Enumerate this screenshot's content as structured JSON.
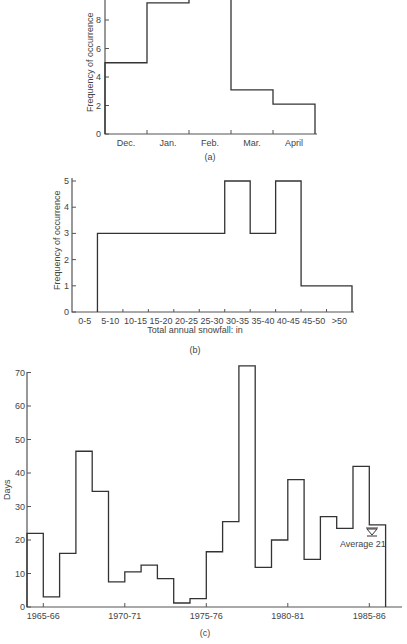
{
  "chart_data": [
    {
      "id": "a",
      "type": "bar",
      "subtype": "step-histogram",
      "caption": "(a)",
      "title": "",
      "xlabel": "",
      "ylabel": "Frequency of occurrence",
      "categories": [
        "Dec.",
        "Jan.",
        "Feb.",
        "Mar.",
        "April"
      ],
      "values": [
        5,
        9.2,
        10,
        3.1,
        2.1
      ],
      "notes": "Feb. bar extends beyond top of visible area (value > 9.4)",
      "yticks": [
        0,
        2,
        4,
        6,
        8
      ],
      "ylim": [
        0,
        9.4
      ],
      "grid": false
    },
    {
      "id": "b",
      "type": "bar",
      "subtype": "step-histogram",
      "caption": "(b)",
      "title": "",
      "xlabel": "Total annual snowfall: in",
      "ylabel": "Frequency of occurrence",
      "categories": [
        "0-5",
        "5-10",
        "10-15",
        "15-20",
        "20-25",
        "25-30",
        "30-35",
        "35-40",
        "40-45",
        "45-50",
        ">50"
      ],
      "values": [
        0,
        3,
        3,
        3,
        3,
        3,
        5,
        3,
        5,
        1,
        1
      ],
      "yticks": [
        0,
        1,
        2,
        3,
        4,
        5
      ],
      "ylim": [
        0,
        5
      ],
      "grid": false
    },
    {
      "id": "c",
      "type": "bar",
      "subtype": "step-histogram",
      "caption": "(c)",
      "title": "",
      "xlabel": "",
      "ylabel": "Days",
      "xtick_labels": [
        "1965-66",
        "1970-71",
        "1975-76",
        "1980-81",
        "1985-86"
      ],
      "x": [
        "1964-65",
        "1965-66",
        "1966-67",
        "1967-68",
        "1968-69",
        "1969-70",
        "1970-71",
        "1971-72",
        "1972-73",
        "1973-74",
        "1974-75",
        "1975-76",
        "1976-77",
        "1977-78",
        "1978-79",
        "1979-80",
        "1980-81",
        "1981-82",
        "1982-83",
        "1983-84",
        "1984-85",
        "1985-86"
      ],
      "values": [
        22,
        3,
        16,
        46.5,
        34.5,
        7.5,
        10.5,
        12.5,
        8.5,
        1.2,
        2.5,
        16.5,
        25.5,
        72,
        11.8,
        20,
        38,
        14.2,
        27,
        23.5,
        42,
        24.5
      ],
      "annotation": "Average 21",
      "yticks": [
        0,
        10,
        20,
        30,
        40,
        50,
        60,
        70
      ],
      "ylim": [
        0,
        72
      ],
      "grid": false
    }
  ]
}
